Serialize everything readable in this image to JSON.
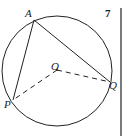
{
  "question_number": "7",
  "points": {
    "A": {
      "label": "A",
      "x": 34,
      "y": 20
    },
    "P": {
      "label": "P",
      "x": 13,
      "y": 100
    },
    "Q": {
      "label": "Q",
      "x": 110,
      "y": 82
    },
    "O": {
      "label": "O",
      "x": 57,
      "y": 70
    }
  },
  "circle": {
    "cx": 57,
    "cy": 71,
    "r": 55
  },
  "colors": {
    "stroke": "#222222",
    "background": "#ffffff"
  }
}
